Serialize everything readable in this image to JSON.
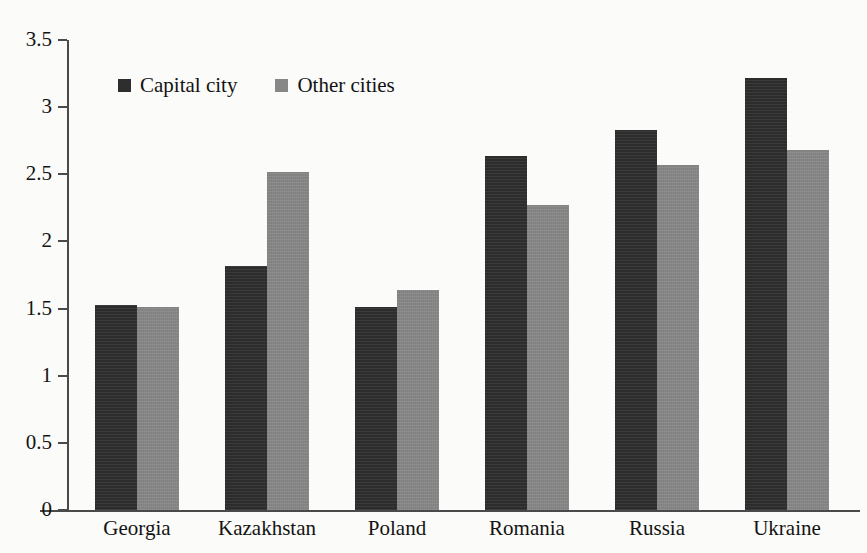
{
  "chart_data": {
    "type": "bar",
    "title": "",
    "xlabel": "",
    "ylabel": "",
    "ylim": [
      0,
      3.5
    ],
    "ytick_step": 0.5,
    "grid": false,
    "legend_position": "top-left-inside",
    "categories": [
      "Georgia",
      "Kazakhstan",
      "Poland",
      "Romania",
      "Russia",
      "Ukraine"
    ],
    "yticks": [
      "0",
      "0.5",
      "1",
      "1.5",
      "2",
      "2.5",
      "3",
      "3.5"
    ],
    "ytick_values": [
      0,
      0.5,
      1,
      1.5,
      2,
      2.5,
      3,
      3.5
    ],
    "series": [
      {
        "name": "Capital city",
        "color": "#2e2e2e",
        "values": [
          1.53,
          1.82,
          1.51,
          2.64,
          2.83,
          3.22
        ]
      },
      {
        "name": "Other cities",
        "color": "#878787",
        "values": [
          1.51,
          2.52,
          1.64,
          2.27,
          2.57,
          2.68
        ]
      }
    ]
  },
  "legend": {
    "items": [
      {
        "label": "Capital city",
        "swatch": "capital"
      },
      {
        "label": "Other cities",
        "swatch": "other"
      }
    ]
  }
}
